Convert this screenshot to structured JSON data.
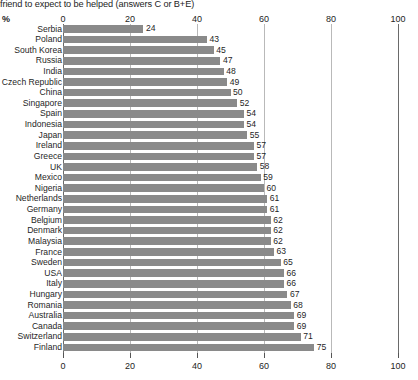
{
  "chart_data": {
    "type": "bar",
    "orientation": "horizontal",
    "title": "friend to expect to be helped (answers C or B+E)",
    "xlabel": "%",
    "ylabel": "",
    "xlim": [
      0,
      100
    ],
    "xticks": [
      0,
      20,
      40,
      60,
      80,
      100
    ],
    "xtick_labels": [
      "0",
      "20",
      "40",
      "60",
      "80",
      "100"
    ],
    "grid": true,
    "grid_axis": "x",
    "legend": "none",
    "axis_top": true,
    "axis_bottom": true,
    "bar_color": "#8a8a8a",
    "categories": [
      "Serbia",
      "Poland",
      "South Korea",
      "Russia",
      "India",
      "Czech Republic",
      "China",
      "Singapore",
      "Spain",
      "Indonesia",
      "Japan",
      "Ireland",
      "Greece",
      "UK",
      "Mexico",
      "Nigeria",
      "Netherlands",
      "Germany",
      "Belgium",
      "Denmark",
      "Malaysia",
      "France",
      "Sweden",
      "USA",
      "Italy",
      "Hungary",
      "Romania",
      "Australia",
      "Canada",
      "Switzerland",
      "Finland"
    ],
    "values": [
      24,
      43,
      45,
      47,
      48,
      49,
      50,
      52,
      54,
      54,
      55,
      57,
      57,
      58,
      59,
      60,
      61,
      61,
      62,
      62,
      62,
      63,
      65,
      66,
      66,
      67,
      68,
      69,
      69,
      71,
      75
    ],
    "data_labels": [
      "24",
      "43",
      "45",
      "47",
      "48",
      "49",
      "50",
      "52",
      "54",
      "54",
      "55",
      "57",
      "57",
      "58",
      "59",
      "60",
      "61",
      "61",
      "62",
      "62",
      "62",
      "63",
      "65",
      "66",
      "66",
      "67",
      "68",
      "69",
      "69",
      "71",
      "75"
    ]
  }
}
